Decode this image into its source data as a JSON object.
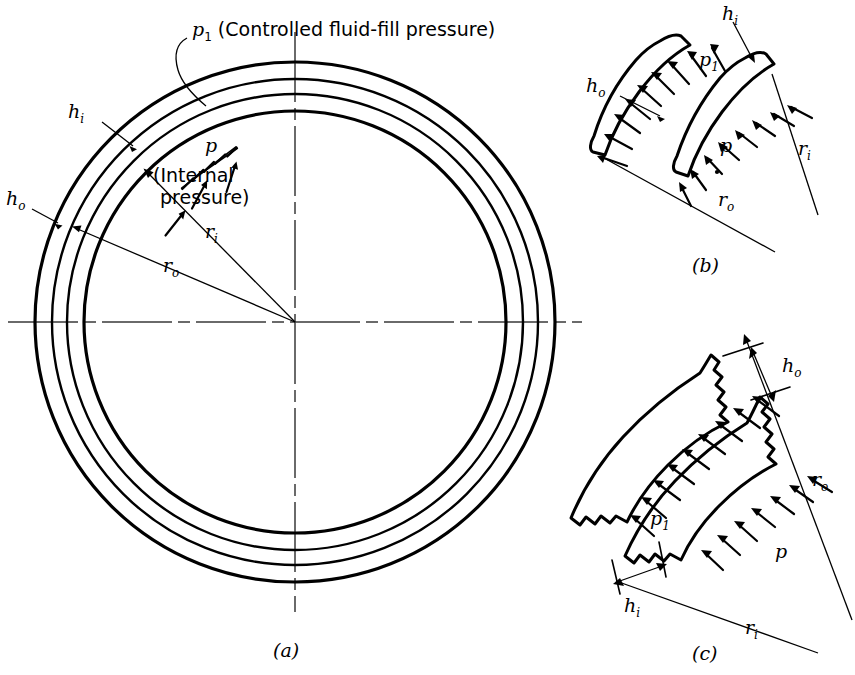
{
  "figure": {
    "background_color": "#ffffff",
    "ink_color": "#000000",
    "panels": [
      {
        "id": "a",
        "label": "(a)",
        "description": "Full cross section of concentric shells"
      },
      {
        "id": "b",
        "label": "(b)",
        "description": "Enlarged detail of thin shell segments"
      },
      {
        "id": "c",
        "label": "(c)",
        "description": "Enlarged detail of thick shell segments"
      }
    ]
  },
  "panel_a": {
    "panel_label": "(a)",
    "callout_p1": "p",
    "callout_p1_sub": "1",
    "callout_p1_text": " (Controlled fluid-fill pressure)",
    "label_p": "p",
    "label_p_note_line1": "(Internal",
    "label_p_note_line2": "pressure)",
    "label_hi": "h",
    "label_hi_sub": "i",
    "label_ho": "h",
    "label_ho_sub": "o",
    "label_ri": "r",
    "label_ri_sub": "i",
    "label_ro": "r",
    "label_ro_sub": "o",
    "circle_center": {
      "x": 295,
      "y": 322
    },
    "circle_radii": [
      260,
      243,
      228,
      211
    ],
    "internal_pressure_arrow_count": 3,
    "fluid_fill_arrow_count": 4
  },
  "panel_b": {
    "panel_label": "(b)",
    "label_hi": "h",
    "label_hi_sub": "i",
    "label_ho": "h",
    "label_ho_sub": "o",
    "label_p": "p",
    "label_p1": "p",
    "label_p1_sub": "1",
    "label_ri": "r",
    "label_ri_sub": "i",
    "label_ro": "r",
    "label_ro_sub": "o",
    "p1_arrow_count": 9,
    "p_arrow_count": 8
  },
  "panel_c": {
    "panel_label": "(c)",
    "label_hi": "h",
    "label_hi_sub": "i",
    "label_ho": "h",
    "label_ho_sub": "o",
    "label_p": "p",
    "label_p1": "p",
    "label_p1_sub": "1",
    "label_ri": "r",
    "label_ri_sub": "i",
    "label_ro": "r",
    "label_ro_sub": "o",
    "p1_arrow_count": 9,
    "p_arrow_count": 7
  }
}
